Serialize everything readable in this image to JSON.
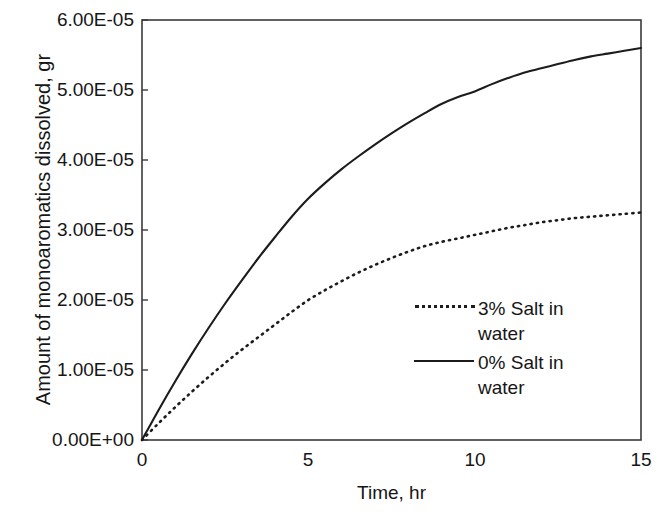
{
  "chart_data": {
    "type": "line",
    "title": "",
    "xlabel": "Time, hr",
    "ylabel": "Amount of monoaromatics dissolved, gr",
    "xlim": [
      0,
      15
    ],
    "ylim": [
      0,
      6e-05
    ],
    "xticks": [
      "0",
      "5",
      "10",
      "15"
    ],
    "xtick_values": [
      0,
      5,
      10,
      15
    ],
    "yticks": [
      "0.00E+00",
      "1.00E-05",
      "2.00E-05",
      "3.00E-05",
      "4.00E-05",
      "5.00E-05",
      "6.00E-05"
    ],
    "ytick_values": [
      0,
      1e-05,
      2e-05,
      3e-05,
      4e-05,
      5e-05,
      6e-05
    ],
    "grid": false,
    "legend_position": "inside-right-center",
    "x": [
      0,
      0.5,
      1,
      1.5,
      2,
      2.5,
      3,
      3.5,
      4,
      4.5,
      5,
      5.5,
      6,
      6.5,
      7,
      7.5,
      8,
      8.5,
      9,
      9.5,
      10,
      10.5,
      11,
      11.5,
      12,
      12.5,
      13,
      13.5,
      14,
      14.5,
      15
    ],
    "series": [
      {
        "name": "0% Salt in water",
        "style": "solid",
        "color": "#1c1c1c",
        "values": [
          0.0,
          4.3e-06,
          8.4e-06,
          1.23e-05,
          1.6e-05,
          1.95e-05,
          2.28e-05,
          2.6e-05,
          2.9e-05,
          3.19e-05,
          3.45e-05,
          3.67e-05,
          3.87e-05,
          4.05e-05,
          4.22e-05,
          4.38e-05,
          4.53e-05,
          4.67e-05,
          4.8e-05,
          4.9e-05,
          4.98e-05,
          5.08e-05,
          5.17e-05,
          5.25e-05,
          5.31e-05,
          5.37e-05,
          5.43e-05,
          5.48e-05,
          5.52e-05,
          5.56e-05,
          5.6e-05
        ]
      },
      {
        "name": "3% Salt in water",
        "style": "dotted",
        "color": "#1c1c1c",
        "values": [
          0.0,
          2.4e-06,
          4.7e-06,
          6.9e-06,
          9e-06,
          1.1e-05,
          1.29e-05,
          1.47e-05,
          1.65e-05,
          1.83e-05,
          2e-05,
          2.14e-05,
          2.27e-05,
          2.39e-05,
          2.5e-05,
          2.6e-05,
          2.69e-05,
          2.77e-05,
          2.83e-05,
          2.88e-05,
          2.93e-05,
          2.98e-05,
          3.03e-05,
          3.07e-05,
          3.11e-05,
          3.14e-05,
          3.17e-05,
          3.19e-05,
          3.21e-05,
          3.23e-05,
          3.25e-05
        ]
      }
    ],
    "legend": [
      {
        "label_line1": "3% Salt in",
        "label_line2": "water",
        "style": "dotted"
      },
      {
        "label_line1": "0% Salt in",
        "label_line2": "water",
        "style": "solid"
      }
    ]
  }
}
